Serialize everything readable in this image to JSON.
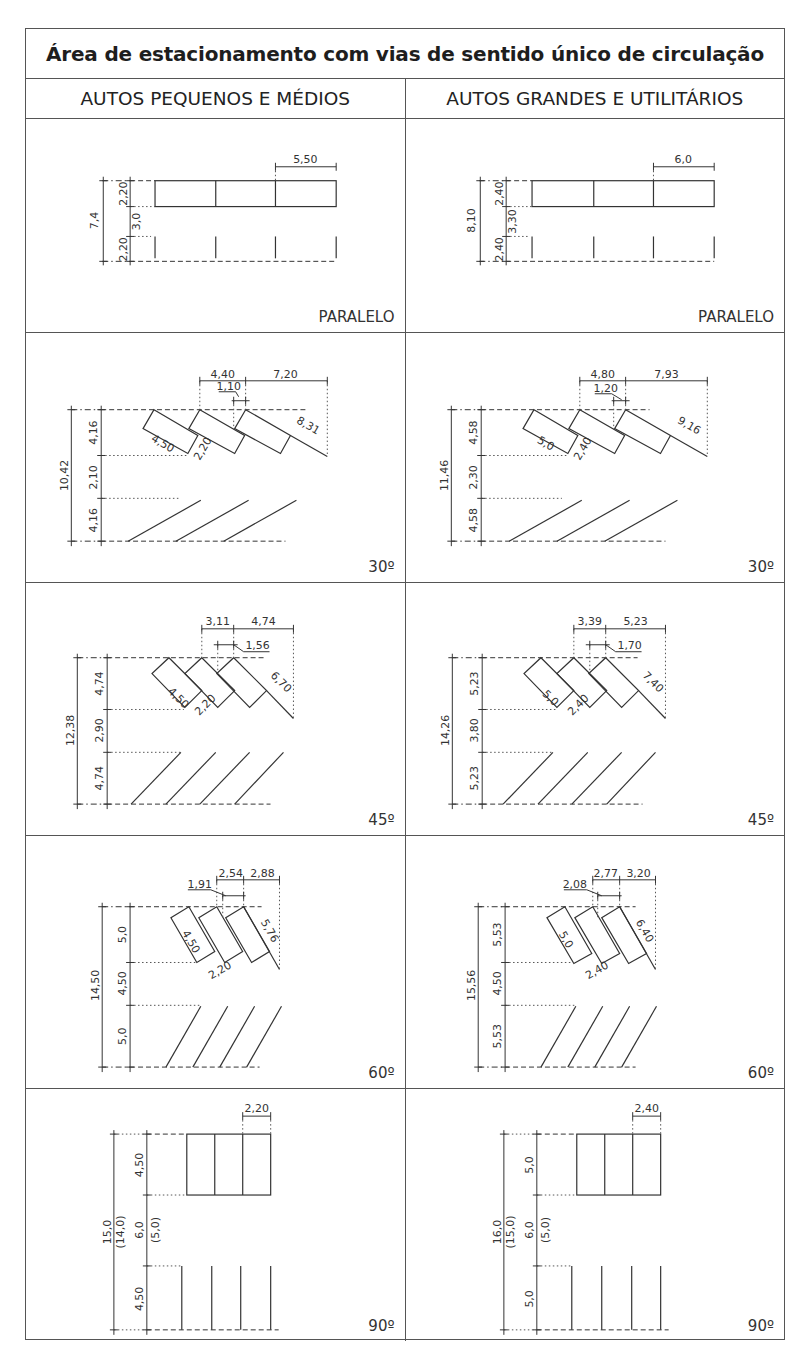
{
  "title": "Área de estacionamento com vias de sentido único de circulação",
  "columns": [
    "AUTOS PEQUENOS E MÉDIOS",
    "AUTOS GRANDES E UTILITÁRIOS"
  ],
  "rows": [
    {
      "angle": "PARALELO",
      "small": {
        "total": "7,4",
        "stall_depth_top": "2,20",
        "aisle": "3,0",
        "stall_depth_bottom": "2,20",
        "stall_length": "5,50"
      },
      "large": {
        "total": "8,10",
        "stall_depth_top": "2,40",
        "aisle": "3,30",
        "stall_depth_bottom": "2,40",
        "stall_length": "6,0"
      }
    },
    {
      "angle": "30º",
      "small": {
        "total": "10,42",
        "stall_depth_top": "4,16",
        "aisle": "2,10",
        "stall_depth_bottom": "4,16",
        "top_spacing": "4,40",
        "top_offset": "7,20",
        "small_offset": "1,10",
        "stall_length": "4,50",
        "stall_width": "2,20",
        "diagonal": "8,31"
      },
      "large": {
        "total": "11,46",
        "stall_depth_top": "4,58",
        "aisle": "2,30",
        "stall_depth_bottom": "4,58",
        "top_spacing": "4,80",
        "top_offset": "7,93",
        "small_offset": "1,20",
        "stall_length": "5,0",
        "stall_width": "2,40",
        "diagonal": "9,16"
      }
    },
    {
      "angle": "45º",
      "small": {
        "total": "12,38",
        "stall_depth_top": "4,74",
        "aisle": "2,90",
        "stall_depth_bottom": "4,74",
        "top_spacing": "3,11",
        "top_offset": "4,74",
        "small_offset": "1,56",
        "stall_length": "4,50",
        "stall_width": "2,20",
        "diagonal": "6,70"
      },
      "large": {
        "total": "14,26",
        "stall_depth_top": "5,23",
        "aisle": "3,80",
        "stall_depth_bottom": "5,23",
        "top_spacing": "3,39",
        "top_offset": "5,23",
        "small_offset": "1,70",
        "stall_length": "5,0",
        "stall_width": "2,40",
        "diagonal": "7,40"
      }
    },
    {
      "angle": "60º",
      "small": {
        "total": "14,50",
        "stall_depth_top": "5,0",
        "aisle": "4,50",
        "stall_depth_bottom": "5,0",
        "top_spacing": "2,54",
        "top_offset": "2,88",
        "small_offset": "1,91",
        "stall_length": "4,50",
        "stall_width": "2,20",
        "diagonal": "5,76"
      },
      "large": {
        "total": "15,56",
        "stall_depth_top": "5,53",
        "aisle": "4,50",
        "stall_depth_bottom": "5,53",
        "top_spacing": "2,77",
        "top_offset": "3,20",
        "small_offset": "2,08",
        "stall_length": "5,0",
        "stall_width": "2,40",
        "diagonal": "6,40"
      }
    },
    {
      "angle": "90º",
      "small": {
        "total": "15,0",
        "total_alt": "(14,0)",
        "stall_depth_top": "4,50",
        "aisle": "6,0",
        "aisle_alt": "(5,0)",
        "stall_depth_bottom": "4,50",
        "stall_width": "2,20"
      },
      "large": {
        "total": "16,0",
        "total_alt": "(15,0)",
        "stall_depth_top": "5,0",
        "aisle": "6,0",
        "aisle_alt": "(5,0)",
        "stall_depth_bottom": "5,0",
        "stall_width": "2,40"
      }
    }
  ]
}
